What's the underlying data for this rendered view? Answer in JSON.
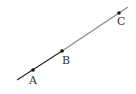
{
  "diagram": {
    "type": "line-with-points",
    "line": {
      "start": [
        17,
        80
      ],
      "end": [
        128,
        7
      ],
      "color_dark": "#222222",
      "color_light": "#888888"
    },
    "points": [
      {
        "label": "A",
        "x": 33,
        "y": 70,
        "label_x": 29,
        "label_y": 84
      },
      {
        "label": "B",
        "x": 62,
        "y": 51,
        "label_x": 62,
        "label_y": 64
      },
      {
        "label": "C",
        "x": 119,
        "y": 13,
        "label_x": 117,
        "label_y": 25
      }
    ]
  }
}
